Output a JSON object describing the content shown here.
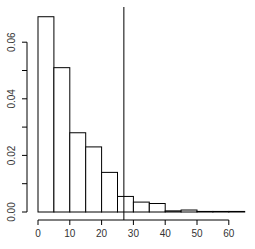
{
  "chart_data": {
    "type": "bar",
    "subtype": "histogram",
    "title": "",
    "xlabel": "",
    "ylabel": "",
    "bin_edges": [
      0,
      5,
      10,
      15,
      20,
      25,
      30,
      35,
      40,
      45,
      50,
      55,
      60,
      65
    ],
    "categories": [
      "0-5",
      "5-10",
      "10-15",
      "15-20",
      "20-25",
      "25-30",
      "30-35",
      "35-40",
      "40-45",
      "45-50",
      "50-55",
      "55-60",
      "60-65"
    ],
    "values": [
      0.069,
      0.051,
      0.028,
      0.023,
      0.014,
      0.0055,
      0.0035,
      0.003,
      0.0004,
      0.0007,
      0.0002,
      0.0002,
      0.0002
    ],
    "xlim": [
      0,
      65
    ],
    "ylim": [
      0,
      0.07
    ],
    "x_ticks": [
      0,
      10,
      20,
      30,
      40,
      50,
      60
    ],
    "x_tick_labels": [
      "0",
      "10",
      "20",
      "30",
      "40",
      "50",
      "60"
    ],
    "y_ticks": [
      0,
      0.01,
      0.02,
      0.03,
      0.04,
      0.05,
      0.06
    ],
    "y_tick_labels": [
      "0.00",
      "",
      "0.02",
      "",
      "0.04",
      "",
      "0.06"
    ],
    "vertical_line": {
      "x": 27,
      "color": "#000000"
    },
    "grid": false,
    "legend": null,
    "bar_fill": "#ffffff",
    "bar_stroke": "#000000"
  }
}
